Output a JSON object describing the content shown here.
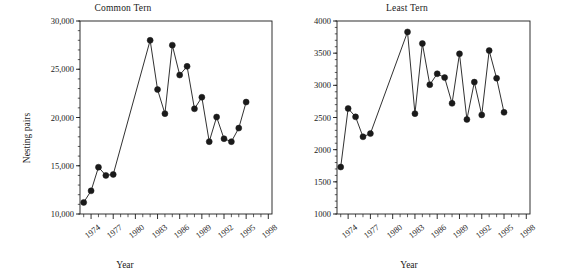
{
  "figure": {
    "width": 564,
    "height": 276,
    "background": "#ffffff",
    "ink_color": "#1a1a1a"
  },
  "chart_data": [
    {
      "type": "line",
      "panel": "left",
      "title": "Common Tern",
      "xlabel": "Year",
      "ylabel": "Nesting pairs",
      "xlim": [
        1972.5,
        1998.5
      ],
      "ylim": [
        10000,
        30000
      ],
      "ytick_labels": [
        "10,000",
        "15,000",
        "20,000",
        "25,000",
        "30,000"
      ],
      "ytick_values": [
        10000,
        15000,
        20000,
        25000,
        30000
      ],
      "xtick_labels": [
        "1974",
        "1977",
        "1980",
        "1983",
        "1986",
        "1989",
        "1992",
        "1995",
        "1998"
      ],
      "xtick_values": [
        1974,
        1977,
        1980,
        1983,
        1986,
        1989,
        1992,
        1995,
        1998
      ],
      "minor_xticks": "every year from 1973 to 1998",
      "grid": false,
      "legend": "none",
      "marker": "filled-circle",
      "x": [
        1973,
        1974,
        1975,
        1976,
        1977,
        1982,
        1983,
        1984,
        1985,
        1986,
        1987,
        1988,
        1989,
        1990,
        1991,
        1992,
        1993,
        1994,
        1995,
        1996
      ],
      "values": [
        11200,
        12400,
        14850,
        14000,
        14100,
        28000,
        22900,
        20400,
        27500,
        24400,
        25300,
        20900,
        22100,
        17500,
        20050,
        17800,
        17500,
        18900,
        21600,
        null
      ],
      "points": [
        {
          "year": 1973,
          "value": 11200
        },
        {
          "year": 1974,
          "value": 12400
        },
        {
          "year": 1975,
          "value": 14850
        },
        {
          "year": 1976,
          "value": 14000
        },
        {
          "year": 1977,
          "value": 14100
        },
        {
          "year": 1982,
          "value": 28000
        },
        {
          "year": 1983,
          "value": 22900
        },
        {
          "year": 1984,
          "value": 20400
        },
        {
          "year": 1985,
          "value": 27500
        },
        {
          "year": 1986,
          "value": 24400
        },
        {
          "year": 1987,
          "value": 25300
        },
        {
          "year": 1988,
          "value": 20900
        },
        {
          "year": 1989,
          "value": 22100
        },
        {
          "year": 1990,
          "value": 17500
        },
        {
          "year": 1991,
          "value": 20050
        },
        {
          "year": 1992,
          "value": 17800
        },
        {
          "year": 1993,
          "value": 17500
        },
        {
          "year": 1994,
          "value": 18900
        },
        {
          "year": 1995,
          "value": 21600
        }
      ]
    },
    {
      "type": "line",
      "panel": "right",
      "title": "Least Tern",
      "xlabel": "Year",
      "ylabel": "",
      "xlim": [
        1972.5,
        1998.5
      ],
      "ylim": [
        1000,
        4000
      ],
      "ytick_labels": [
        "1000",
        "1500",
        "2000",
        "2500",
        "3000",
        "3500",
        "4000"
      ],
      "ytick_values": [
        1000,
        1500,
        2000,
        2500,
        3000,
        3500,
        4000
      ],
      "xtick_labels": [
        "1974",
        "1977",
        "1980",
        "1983",
        "1986",
        "1989",
        "1992",
        "1995",
        "1998"
      ],
      "xtick_values": [
        1974,
        1977,
        1980,
        1983,
        1986,
        1989,
        1992,
        1995,
        1998
      ],
      "minor_xticks": "every year from 1973 to 1998",
      "grid": false,
      "legend": "none",
      "marker": "filled-circle",
      "points": [
        {
          "year": 1973,
          "value": 1730
        },
        {
          "year": 1974,
          "value": 2640
        },
        {
          "year": 1975,
          "value": 2510
        },
        {
          "year": 1976,
          "value": 2200
        },
        {
          "year": 1977,
          "value": 2250
        },
        {
          "year": 1982,
          "value": 3830
        },
        {
          "year": 1983,
          "value": 2560
        },
        {
          "year": 1984,
          "value": 3650
        },
        {
          "year": 1985,
          "value": 3010
        },
        {
          "year": 1986,
          "value": 3180
        },
        {
          "year": 1987,
          "value": 3120
        },
        {
          "year": 1988,
          "value": 2720
        },
        {
          "year": 1989,
          "value": 3490
        },
        {
          "year": 1990,
          "value": 2470
        },
        {
          "year": 1991,
          "value": 3050
        },
        {
          "year": 1992,
          "value": 2540
        },
        {
          "year": 1993,
          "value": 3540
        },
        {
          "year": 1994,
          "value": 3110
        },
        {
          "year": 1995,
          "value": 2580
        }
      ]
    }
  ]
}
